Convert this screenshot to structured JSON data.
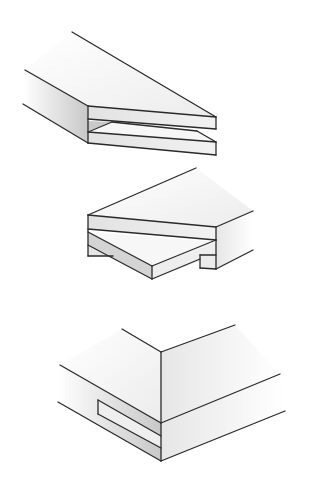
{
  "figure": {
    "title": "",
    "colors": {
      "background": "#ffffff",
      "line": "#2a2a2a",
      "face_light": "#f4f4f4",
      "face_mid": "#dcdcdc",
      "face_dark": "#c4c4c4"
    },
    "items": [
      {
        "name": "tongue-and-groove-open-joint",
        "position": "top"
      },
      {
        "name": "rabbeted-lap-joint",
        "position": "middle"
      },
      {
        "name": "corner-slot-joint",
        "position": "bottom"
      }
    ]
  }
}
